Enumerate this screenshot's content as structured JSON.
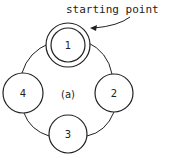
{
  "diagram": {
    "annotation": "starting point",
    "caption": "(a)",
    "nodes": [
      {
        "id": "1",
        "label": "1",
        "start": true
      },
      {
        "id": "2",
        "label": "2"
      },
      {
        "id": "3",
        "label": "3"
      },
      {
        "id": "4",
        "label": "4"
      }
    ],
    "edges": [
      {
        "from": "1",
        "to": "2"
      },
      {
        "from": "2",
        "to": "3"
      },
      {
        "from": "3",
        "to": "4"
      },
      {
        "from": "4",
        "to": "1"
      }
    ],
    "colors": {
      "stroke": "#222222",
      "background": "#ffffff"
    }
  }
}
